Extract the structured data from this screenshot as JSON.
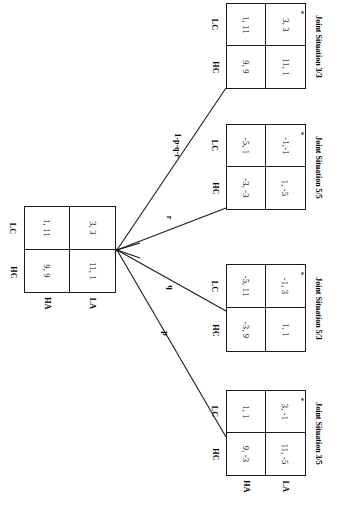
{
  "figure": {
    "type": "game-theory-extensive-form-tree",
    "orientation": "rotated-90-clockwise"
  },
  "root_matrix": {
    "name": "root-payoff-matrix",
    "col_labels": [
      "HC",
      "LC"
    ],
    "row_labels": [
      "HA",
      "LA"
    ],
    "cells": {
      "ha_hc": "9, 9",
      "ha_lc": "1, 11",
      "la_hc": "11, 1",
      "la_lc": "3, 3"
    }
  },
  "edges": [
    {
      "id": "edge-p",
      "label": "p"
    },
    {
      "id": "edge-q",
      "label": "q"
    },
    {
      "id": "edge-r",
      "label": "r"
    },
    {
      "id": "edge-rest",
      "label": "1-p-q-r"
    }
  ],
  "branches": [
    {
      "id": "branch-3-3",
      "caption": "Joint Situation 3/3",
      "edge_label": "1-p-q-r",
      "col_labels": [
        "HC",
        "LC"
      ],
      "row_labels": [
        "HA",
        "LA"
      ],
      "cells": {
        "ha_hc": "9, 9",
        "ha_lc": "1, 11",
        "la_hc": "11, 1",
        "la_lc": "3, 3"
      },
      "equilibrium_marker": "*",
      "equilibrium_cell": "la_lc"
    },
    {
      "id": "branch-5-5",
      "caption": "Joint Situation 5/5",
      "edge_label": "r",
      "col_labels": [
        "HC",
        "LC"
      ],
      "row_labels": [
        "HA",
        "LA"
      ],
      "cells": {
        "ha_hc": "-3, -3",
        "ha_lc": "-5, 1",
        "la_hc": "1, -5",
        "la_lc": "-1,-1"
      },
      "equilibrium_marker": "*",
      "equilibrium_cell": "la_lc"
    },
    {
      "id": "branch-5-3",
      "caption": "Joint Situation 5/3",
      "edge_label": "q",
      "col_labels": [
        "HC",
        "LC"
      ],
      "row_labels": [
        "HA",
        "LA"
      ],
      "cells": {
        "ha_hc": "-3, 9",
        "ha_lc": "-5, 11",
        "la_hc": "1, 1",
        "la_lc": "-1, 3"
      },
      "equilibrium_marker": "*",
      "equilibrium_cell": "la_lc"
    },
    {
      "id": "branch-3-5",
      "caption": "Joint Situation 3/5",
      "edge_label": "p",
      "col_labels": [
        "HC",
        "LC"
      ],
      "row_labels": [
        "HA",
        "LA"
      ],
      "cells": {
        "ha_hc": "9, -3",
        "ha_lc": "1, 1",
        "la_hc": "11, -5",
        "la_lc": "3, -1"
      },
      "equilibrium_marker": "*",
      "equilibrium_cell": "la_lc"
    }
  ],
  "colors": {
    "ink": "#1a1a1a",
    "background": "#ffffff"
  }
}
